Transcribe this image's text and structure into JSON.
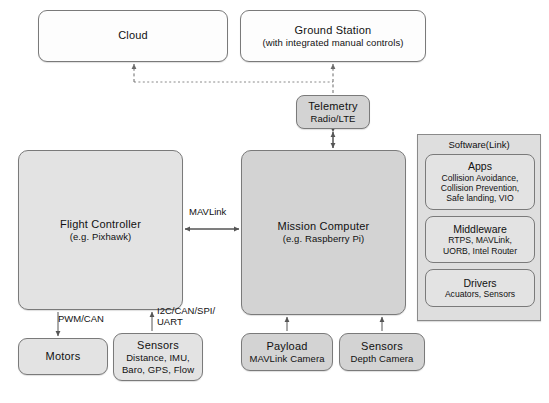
{
  "diagram": {
    "colors": {
      "node_border": "#7a7a7a",
      "fill_white": "#fdfdfd",
      "fill_light": "#e3e3e3",
      "fill_gray": "#d3d3d3",
      "panel_fill": "#dedede",
      "wire": "#555555",
      "background": "#ffffff"
    }
  },
  "nodes": {
    "cloud": {
      "title": "Cloud"
    },
    "ground_station": {
      "title": "Ground Station",
      "sub": "(with integrated manual controls)"
    },
    "telemetry": {
      "title": "Telemetry",
      "sub": "Radio/LTE"
    },
    "flight_controller": {
      "title": "Flight Controller",
      "sub": "(e.g. Pixhawk)"
    },
    "mission_computer": {
      "title": "Mission Computer",
      "sub": "(e.g. Raspberry Pi)"
    },
    "motors": {
      "title": "Motors"
    },
    "fc_sensors": {
      "title": "Sensors",
      "sub_line1": "Distance, IMU,",
      "sub_line2": "Baro, GPS, Flow"
    },
    "payload": {
      "title": "Payload",
      "sub": "MAVLink Camera"
    },
    "mc_sensors": {
      "title": "Sensors",
      "sub": "Depth Camera"
    }
  },
  "software_panel": {
    "label": "Software(Link)",
    "boxes": [
      {
        "title": "Apps",
        "sub_line1": "Collision Avoidance,",
        "sub_line2": "Collision Prevention,",
        "sub_line3": "Safe landing, VIO"
      },
      {
        "title": "Middleware",
        "sub_line1": "RTPS, MAVLink,",
        "sub_line2": "UORB, Intel Router"
      },
      {
        "title": "Drivers",
        "sub_line1": "Acuators, Sensors"
      }
    ]
  },
  "edge_labels": {
    "mavlink": "MAVLink",
    "pwm_can": "PWM/CAN",
    "i2c_line1": "I2C/CAN/SPI/",
    "i2c_line2": "UART"
  }
}
